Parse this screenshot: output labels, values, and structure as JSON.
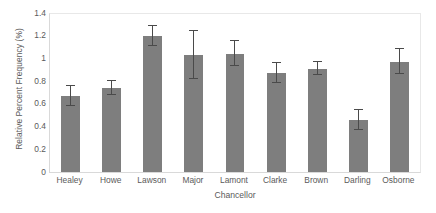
{
  "chart_data": {
    "type": "bar",
    "title": "",
    "xlabel": "Chancellor",
    "ylabel": "Relative Percent Frequency (%)",
    "categories": [
      "Healey",
      "Howe",
      "Lawson",
      "Major",
      "Lamont",
      "Clarke",
      "Brown",
      "Darling",
      "Osborne"
    ],
    "values": [
      0.67,
      0.74,
      1.2,
      1.03,
      1.04,
      0.87,
      0.91,
      0.46,
      0.97
    ],
    "errors": [
      0.09,
      0.06,
      0.09,
      0.21,
      0.11,
      0.09,
      0.06,
      0.09,
      0.11
    ],
    "ylim": [
      0,
      1.4
    ],
    "yticks": [
      0,
      0.2,
      0.4,
      0.6,
      0.8,
      1,
      1.2,
      1.4
    ],
    "ytick_labels": [
      "0",
      "0.2",
      "0.4",
      "0.6",
      "0.8",
      "1",
      "1.2",
      "1.4"
    ],
    "grid": false,
    "legend": null,
    "bar_color": "#7e7e7e",
    "error_color": "#4a4a4a",
    "axis_color": "#d9d9d9",
    "text_color": "#5a5a5a",
    "background": "#ffffff",
    "error_bar_style": "symmetric-caps"
  }
}
